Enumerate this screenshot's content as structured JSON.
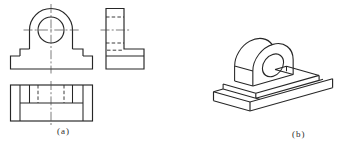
{
  "figure": {
    "label_a": "(a)",
    "label_b": "(b)",
    "line_color": "#262626",
    "centerline_color": "#4a4a4a",
    "background": "#ffffff"
  }
}
